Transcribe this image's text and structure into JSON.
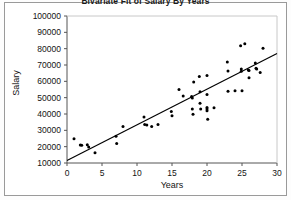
{
  "chart_data": {
    "type": "scatter",
    "title": "Bivariate Fit of Salary By Years",
    "xlabel": "Years",
    "ylabel": "Salary",
    "xlim": [
      0,
      30
    ],
    "ylim": [
      10000,
      100000
    ],
    "xticks": [
      "0",
      "5",
      "10",
      "15",
      "20",
      "25",
      "30"
    ],
    "yticks": [
      "10000",
      "20000",
      "30000",
      "40000",
      "50000",
      "60000",
      "70000",
      "80000",
      "90000",
      "100000"
    ],
    "xtick_values": [
      0,
      5,
      10,
      15,
      20,
      25,
      30
    ],
    "ytick_values": [
      10000,
      20000,
      30000,
      40000,
      50000,
      60000,
      70000,
      80000,
      90000,
      100000
    ],
    "grid": false,
    "legend": "none",
    "marker_color": "#000000",
    "line_color": "#000000",
    "axis_color": "#555555",
    "fit_line": {
      "name": "Linear fit",
      "x": [
        0,
        30
      ],
      "y": [
        11500,
        77000
      ]
    },
    "points": [
      {
        "x": 1.0,
        "y": 24800
      },
      {
        "x": 1.9,
        "y": 21000
      },
      {
        "x": 2.1,
        "y": 20800
      },
      {
        "x": 2.9,
        "y": 21200
      },
      {
        "x": 3.1,
        "y": 19800
      },
      {
        "x": 4.0,
        "y": 16200
      },
      {
        "x": 7.0,
        "y": 26400
      },
      {
        "x": 7.1,
        "y": 22000
      },
      {
        "x": 8.0,
        "y": 32300
      },
      {
        "x": 11.0,
        "y": 38200
      },
      {
        "x": 11.1,
        "y": 33500
      },
      {
        "x": 11.4,
        "y": 33200
      },
      {
        "x": 12.1,
        "y": 32300
      },
      {
        "x": 13.0,
        "y": 33600
      },
      {
        "x": 14.9,
        "y": 41600
      },
      {
        "x": 15.0,
        "y": 39000
      },
      {
        "x": 16.0,
        "y": 55000
      },
      {
        "x": 16.6,
        "y": 51000
      },
      {
        "x": 17.8,
        "y": 50700
      },
      {
        "x": 17.9,
        "y": 49800
      },
      {
        "x": 17.9,
        "y": 43000
      },
      {
        "x": 18.0,
        "y": 39900
      },
      {
        "x": 18.1,
        "y": 59600
      },
      {
        "x": 18.9,
        "y": 63000
      },
      {
        "x": 19.0,
        "y": 53600
      },
      {
        "x": 19.0,
        "y": 46600
      },
      {
        "x": 19.1,
        "y": 43000
      },
      {
        "x": 20.0,
        "y": 63500
      },
      {
        "x": 20.0,
        "y": 52000
      },
      {
        "x": 20.0,
        "y": 44000
      },
      {
        "x": 20.0,
        "y": 43000
      },
      {
        "x": 20.0,
        "y": 42000
      },
      {
        "x": 20.1,
        "y": 36800
      },
      {
        "x": 21.0,
        "y": 43800
      },
      {
        "x": 22.9,
        "y": 71800
      },
      {
        "x": 23.0,
        "y": 66300
      },
      {
        "x": 23.0,
        "y": 54000
      },
      {
        "x": 24.0,
        "y": 54200
      },
      {
        "x": 24.8,
        "y": 81800
      },
      {
        "x": 24.9,
        "y": 67500
      },
      {
        "x": 24.9,
        "y": 66200
      },
      {
        "x": 25.0,
        "y": 54200
      },
      {
        "x": 25.4,
        "y": 83000
      },
      {
        "x": 25.9,
        "y": 67000
      },
      {
        "x": 26.0,
        "y": 66700
      },
      {
        "x": 26.0,
        "y": 62200
      },
      {
        "x": 26.9,
        "y": 71200
      },
      {
        "x": 27.0,
        "y": 68000
      },
      {
        "x": 27.1,
        "y": 67600
      },
      {
        "x": 27.6,
        "y": 65400
      },
      {
        "x": 28.0,
        "y": 80200
      }
    ]
  }
}
